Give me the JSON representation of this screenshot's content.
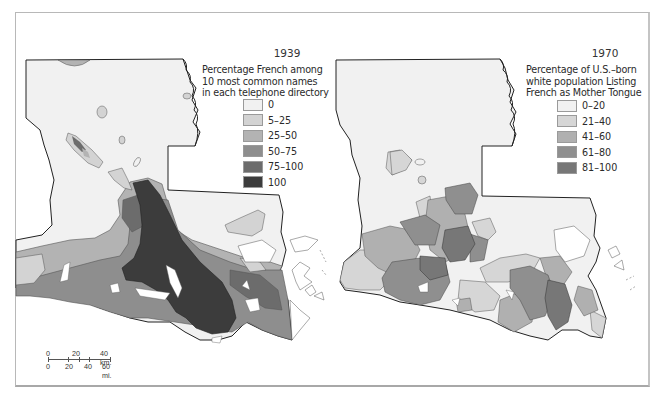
{
  "maps": [
    {
      "year": "1939",
      "subtitle_lines": [
        "Percentage French among",
        "10 most common names",
        "in each telephone directory"
      ],
      "legend": [
        {
          "label": "0",
          "color": "#f1f1f1"
        },
        {
          "label": "5–25",
          "color": "#d3d3d3"
        },
        {
          "label": "25–50",
          "color": "#b3b3b3"
        },
        {
          "label": "50–75",
          "color": "#8e8e8e"
        },
        {
          "label": "75–100",
          "color": "#6c6c6c"
        },
        {
          "label": "100",
          "color": "#3c3c3c"
        }
      ]
    },
    {
      "year": "1970",
      "subtitle_lines": [
        "Percentage of U.S.–born",
        "white population Listing",
        "French as Mother Tongue"
      ],
      "legend": [
        {
          "label": "0–20",
          "color": "#f1f1f1"
        },
        {
          "label": "21–40",
          "color": "#d6d6d6"
        },
        {
          "label": "41–60",
          "color": "#b0b0b0"
        },
        {
          "label": "61–80",
          "color": "#8f8f8f"
        },
        {
          "label": "81–100",
          "color": "#777777"
        }
      ]
    }
  ],
  "scale_bar": {
    "km_labels": [
      "0",
      "20",
      "40 km."
    ],
    "mi_labels": [
      "0",
      "20",
      "40",
      "60 mi."
    ]
  }
}
